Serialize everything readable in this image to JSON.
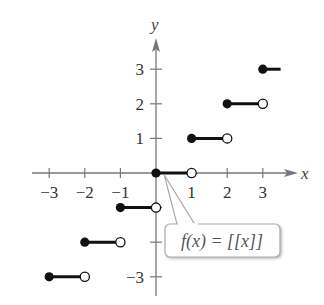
{
  "chart_data": {
    "type": "line",
    "title": "",
    "function_label": "f(x) = [[x]]",
    "xlabel": "x",
    "ylabel": "y",
    "xlim": [
      -3.3,
      3.8
    ],
    "ylim": [
      -3.3,
      3.8
    ],
    "grid": false,
    "x_ticks": [
      -3,
      -2,
      -1,
      1,
      2,
      3
    ],
    "x_tick_labels": [
      "−3",
      "−2",
      "−1",
      "1",
      "2",
      "3"
    ],
    "y_ticks": [
      3,
      2,
      1,
      -3
    ],
    "y_tick_labels": [
      "3",
      "2",
      "1",
      "−3"
    ],
    "segments": [
      {
        "x_start": -3,
        "x_end": -2,
        "y": -3,
        "start": "closed",
        "end": "open"
      },
      {
        "x_start": -2,
        "x_end": -1,
        "y": -2,
        "start": "closed",
        "end": "open"
      },
      {
        "x_start": -1,
        "x_end": 0,
        "y": -1,
        "start": "closed",
        "end": "open"
      },
      {
        "x_start": 0,
        "x_end": 1,
        "y": 0,
        "start": "closed",
        "end": "open"
      },
      {
        "x_start": 1,
        "x_end": 2,
        "y": 1,
        "start": "closed",
        "end": "open"
      },
      {
        "x_start": 2,
        "x_end": 3,
        "y": 2,
        "start": "closed",
        "end": "open"
      },
      {
        "x_start": 3,
        "x_end": 3.5,
        "y": 3,
        "start": "closed",
        "end": "continues"
      }
    ],
    "annotations": [
      {
        "text": "f(x) = [[x]]",
        "points_to": [
          0.5,
          0
        ]
      }
    ],
    "colors": {
      "axis": "#777777",
      "segment": "#111111",
      "callout_border": "#aaaaaa"
    }
  }
}
